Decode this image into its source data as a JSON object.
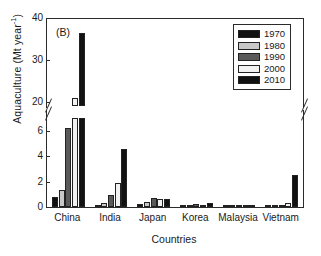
{
  "panel_tag": "(B)",
  "axis": {
    "ylabel_main": "Aquaculture (Mt year",
    "ylabel_sup": "-1",
    "ylabel_close": ")",
    "xlabel": "Countries"
  },
  "legend": {
    "items": [
      {
        "label": "1970",
        "color": "#111111"
      },
      {
        "label": "1980",
        "color": "#c8c8c8"
      },
      {
        "label": "1990",
        "color": "#5a5a5a"
      },
      {
        "label": "2000",
        "color": "#f2f2f2"
      },
      {
        "label": "2010",
        "color": "#111111"
      }
    ]
  },
  "chart_data": {
    "type": "bar",
    "title": "(B)",
    "xlabel": "Countries",
    "ylabel": "Aquaculture (Mt year-1)",
    "categories": [
      "China",
      "India",
      "Japan",
      "Korea",
      "Malaysia",
      "Vietnam"
    ],
    "series": [
      {
        "name": "1970",
        "color": "#111111",
        "values": [
          0.75,
          0.06,
          0.25,
          0.02,
          0.01,
          0.01
        ]
      },
      {
        "name": "1980",
        "color": "#c8c8c8",
        "values": [
          1.32,
          0.3,
          0.42,
          0.15,
          0.02,
          0.02
        ]
      },
      {
        "name": "1990",
        "color": "#5a5a5a",
        "values": [
          6.22,
          0.92,
          0.7,
          0.23,
          0.05,
          0.06
        ]
      },
      {
        "name": "2000",
        "color": "#f2f2f2",
        "values": [
          21.0,
          1.9,
          0.66,
          0.17,
          0.07,
          0.3
        ]
      },
      {
        "name": "2010",
        "color": "#111111",
        "values": [
          36.5,
          4.55,
          0.6,
          0.29,
          0.18,
          2.48
        ]
      }
    ],
    "broken_axis": true,
    "lower_axis": {
      "ticks": [
        0,
        2,
        4,
        6
      ],
      "range": [
        0,
        7.0
      ]
    },
    "upper_axis": {
      "ticks": [
        20,
        30,
        40
      ],
      "range": [
        19.0,
        40.0
      ]
    },
    "grid": false,
    "legend_position": "top-right"
  }
}
